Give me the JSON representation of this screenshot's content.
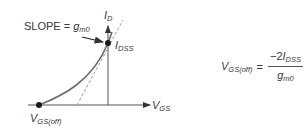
{
  "diagram": {
    "slope_label": {
      "prefix": "SLOPE = ",
      "var": "g",
      "sub": "m0"
    },
    "y_axis_label": {
      "var": "I",
      "sub": "D"
    },
    "x_axis_label": {
      "var": "V",
      "sub": "GS"
    },
    "peak_point_label": {
      "var": "I",
      "sub": "DSS"
    },
    "origin_point_label": {
      "var": "V",
      "sub": "GS(off)"
    },
    "formula": {
      "lhs": {
        "var": "V",
        "sub": "GS(off)"
      },
      "equals": "=",
      "numerator": {
        "prefix": "−2",
        "var": "I",
        "sub": "DSS"
      },
      "denominator": {
        "var": "g",
        "sub": "m0"
      }
    },
    "colors": {
      "axis": "#555555",
      "curve": "#6b6b6b",
      "tangent": "#999999",
      "point": "#1a1a1a",
      "text": "#3a3a3a"
    }
  }
}
